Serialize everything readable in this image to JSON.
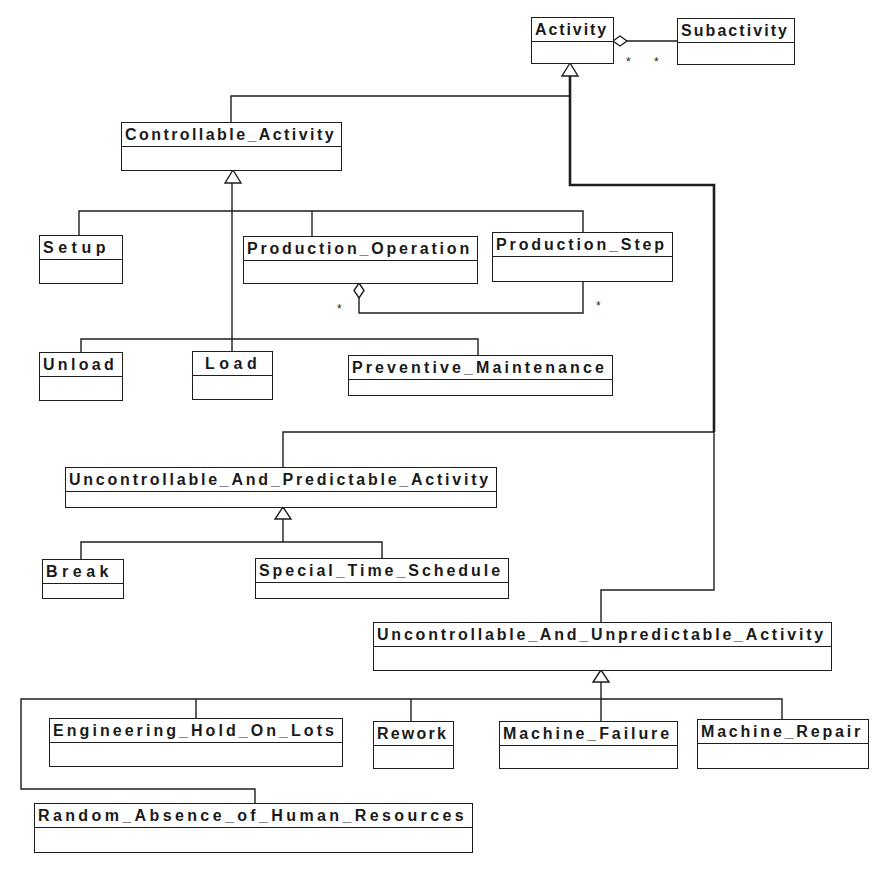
{
  "diagram": {
    "classes": [
      {
        "name": "Activity"
      },
      {
        "name": "Subactivity"
      },
      {
        "name": "Controllable_Activity"
      },
      {
        "name": "Setup"
      },
      {
        "name": "Production_Operation"
      },
      {
        "name": "Production_Step"
      },
      {
        "name": "Unload"
      },
      {
        "name": "Load"
      },
      {
        "name": "Preventive_Maintenance"
      },
      {
        "name": "Uncontrollable_And_Predictable_Activity"
      },
      {
        "name": "Break"
      },
      {
        "name": "Special_Time_Schedule"
      },
      {
        "name": "Uncontrollable_And_Unpredictable_Activity"
      },
      {
        "name": "Engineering_Hold_On_Lots"
      },
      {
        "name": "Rework"
      },
      {
        "name": "Machine_Failure"
      },
      {
        "name": "Machine_Repair"
      },
      {
        "name": "Random_Absence_of_Human_Resources"
      }
    ],
    "aggregations": [
      {
        "whole": "Activity",
        "part": "Subactivity",
        "multiplicity_whole": "*",
        "multiplicity_part": "*"
      },
      {
        "whole": "Production_Operation",
        "part": "Production_Step",
        "multiplicity_whole": "*",
        "multiplicity_part": "*"
      }
    ],
    "generalizations": [
      {
        "parent": "Activity",
        "children": [
          "Controllable_Activity",
          "Uncontrollable_And_Predictable_Activity",
          "Uncontrollable_And_Unpredictable_Activity"
        ]
      },
      {
        "parent": "Controllable_Activity",
        "children": [
          "Setup",
          "Production_Operation",
          "Production_Step",
          "Unload",
          "Load",
          "Preventive_Maintenance"
        ]
      },
      {
        "parent": "Uncontrollable_And_Predictable_Activity",
        "children": [
          "Break",
          "Special_Time_Schedule"
        ]
      },
      {
        "parent": "Uncontrollable_And_Unpredictable_Activity",
        "children": [
          "Engineering_Hold_On_Lots",
          "Rework",
          "Machine_Failure",
          "Machine_Repair",
          "Random_Absence_of_Human_Resources"
        ]
      }
    ],
    "colors": {
      "line": "#1e1e1e",
      "background": "#ffffff"
    }
  }
}
